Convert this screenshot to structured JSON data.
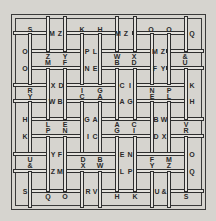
{
  "puzzle": {
    "type": "woven-bars-letter-grid",
    "letters": [
      {
        "t": "S",
        "x": 30,
        "y": 29
      },
      {
        "t": "M",
        "x": 52,
        "y": 33
      },
      {
        "t": "Z",
        "x": 60,
        "y": 33
      },
      {
        "t": "K",
        "x": 82,
        "y": 29
      },
      {
        "t": "H",
        "x": 100,
        "y": 29
      },
      {
        "t": "M",
        "x": 118,
        "y": 33
      },
      {
        "t": "Z",
        "x": 126,
        "y": 33
      },
      {
        "t": "O",
        "x": 151,
        "y": 29
      },
      {
        "t": "O",
        "x": 169,
        "y": 29
      },
      {
        "t": "Q",
        "x": 192,
        "y": 33
      },
      {
        "t": "O",
        "x": 25,
        "y": 51
      },
      {
        "t": "P",
        "x": 87,
        "y": 51
      },
      {
        "t": "L",
        "x": 95,
        "y": 51
      },
      {
        "t": "M",
        "x": 155,
        "y": 51
      },
      {
        "t": "Z",
        "x": 163,
        "y": 51
      },
      {
        "t": "Z",
        "x": 48,
        "y": 56
      },
      {
        "t": "Y",
        "x": 65,
        "y": 56
      },
      {
        "t": "W",
        "x": 117,
        "y": 56
      },
      {
        "t": "X",
        "x": 134,
        "y": 56
      },
      {
        "t": "&",
        "x": 185,
        "y": 56
      },
      {
        "t": "M",
        "x": 48,
        "y": 62
      },
      {
        "t": "F",
        "x": 65,
        "y": 62
      },
      {
        "t": "B",
        "x": 117,
        "y": 62
      },
      {
        "t": "D",
        "x": 134,
        "y": 62
      },
      {
        "t": "U",
        "x": 185,
        "y": 62
      },
      {
        "t": "O",
        "x": 25,
        "y": 68
      },
      {
        "t": "N",
        "x": 87,
        "y": 68
      },
      {
        "t": "E",
        "x": 95,
        "y": 68
      },
      {
        "t": "F",
        "x": 155,
        "y": 68
      },
      {
        "t": "Y",
        "x": 163,
        "y": 68
      },
      {
        "t": "X",
        "x": 53,
        "y": 85
      },
      {
        "t": "D",
        "x": 61,
        "y": 85
      },
      {
        "t": "C",
        "x": 122,
        "y": 85
      },
      {
        "t": "I",
        "x": 130,
        "y": 85
      },
      {
        "t": "K",
        "x": 192,
        "y": 85
      },
      {
        "t": "R",
        "x": 30,
        "y": 90
      },
      {
        "t": "I",
        "x": 82,
        "y": 90
      },
      {
        "t": "G",
        "x": 100,
        "y": 90
      },
      {
        "t": "N",
        "x": 152,
        "y": 90
      },
      {
        "t": "P",
        "x": 169,
        "y": 90
      },
      {
        "t": "Y",
        "x": 30,
        "y": 96
      },
      {
        "t": "C",
        "x": 82,
        "y": 96
      },
      {
        "t": "A",
        "x": 100,
        "y": 96
      },
      {
        "t": "E",
        "x": 152,
        "y": 96
      },
      {
        "t": "L",
        "x": 169,
        "y": 96
      },
      {
        "t": "W",
        "x": 52,
        "y": 101
      },
      {
        "t": "B",
        "x": 60,
        "y": 101
      },
      {
        "t": "A",
        "x": 122,
        "y": 101
      },
      {
        "t": "G",
        "x": 130,
        "y": 101
      },
      {
        "t": "H",
        "x": 192,
        "y": 101
      },
      {
        "t": "H",
        "x": 25,
        "y": 119
      },
      {
        "t": "G",
        "x": 87,
        "y": 119
      },
      {
        "t": "A",
        "x": 95,
        "y": 119
      },
      {
        "t": "B",
        "x": 156,
        "y": 119
      },
      {
        "t": "W",
        "x": 164,
        "y": 119
      },
      {
        "t": "L",
        "x": 48,
        "y": 124
      },
      {
        "t": "E",
        "x": 65,
        "y": 124
      },
      {
        "t": "A",
        "x": 117,
        "y": 124
      },
      {
        "t": "C",
        "x": 134,
        "y": 124
      },
      {
        "t": "V",
        "x": 186,
        "y": 124
      },
      {
        "t": "P",
        "x": 48,
        "y": 130
      },
      {
        "t": "N",
        "x": 65,
        "y": 130
      },
      {
        "t": "G",
        "x": 117,
        "y": 130
      },
      {
        "t": "I",
        "x": 134,
        "y": 130
      },
      {
        "t": "R",
        "x": 186,
        "y": 130
      },
      {
        "t": "K",
        "x": 25,
        "y": 136
      },
      {
        "t": "I",
        "x": 88,
        "y": 136
      },
      {
        "t": "C",
        "x": 95,
        "y": 136
      },
      {
        "t": "D",
        "x": 156,
        "y": 136
      },
      {
        "t": "X",
        "x": 164,
        "y": 136
      },
      {
        "t": "Y",
        "x": 53,
        "y": 154
      },
      {
        "t": "F",
        "x": 60,
        "y": 154
      },
      {
        "t": "E",
        "x": 122,
        "y": 154
      },
      {
        "t": "N",
        "x": 130,
        "y": 154
      },
      {
        "t": "O",
        "x": 192,
        "y": 154
      },
      {
        "t": "U",
        "x": 30,
        "y": 159
      },
      {
        "t": "D",
        "x": 83,
        "y": 159
      },
      {
        "t": "B",
        "x": 100,
        "y": 159
      },
      {
        "t": "F",
        "x": 152,
        "y": 159
      },
      {
        "t": "M",
        "x": 169,
        "y": 159
      },
      {
        "t": "&",
        "x": 30,
        "y": 165
      },
      {
        "t": "X",
        "x": 83,
        "y": 165
      },
      {
        "t": "W",
        "x": 100,
        "y": 165
      },
      {
        "t": "Y",
        "x": 152,
        "y": 165
      },
      {
        "t": "Z",
        "x": 169,
        "y": 165
      },
      {
        "t": "Z",
        "x": 53,
        "y": 171
      },
      {
        "t": "M",
        "x": 60,
        "y": 171
      },
      {
        "t": "L",
        "x": 122,
        "y": 171
      },
      {
        "t": "P",
        "x": 130,
        "y": 171
      },
      {
        "t": "Q",
        "x": 192,
        "y": 171
      },
      {
        "t": "S",
        "x": 25,
        "y": 191
      },
      {
        "t": "R",
        "x": 88,
        "y": 191
      },
      {
        "t": "V",
        "x": 95,
        "y": 191
      },
      {
        "t": "U",
        "x": 157,
        "y": 191
      },
      {
        "t": "&",
        "x": 164,
        "y": 191
      },
      {
        "t": "Q",
        "x": 48,
        "y": 196
      },
      {
        "t": "O",
        "x": 65,
        "y": 196
      },
      {
        "t": "H",
        "x": 117,
        "y": 196
      },
      {
        "t": "K",
        "x": 135,
        "y": 196
      },
      {
        "t": "S",
        "x": 186,
        "y": 196
      }
    ]
  }
}
